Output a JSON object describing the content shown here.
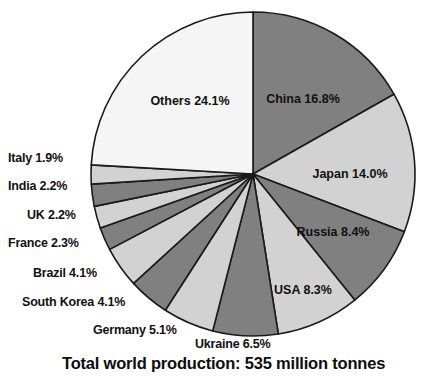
{
  "chart_data": {
    "type": "pie",
    "title": "Total world production: 535 million tonnes",
    "title_truncated": true,
    "total_label": "Total world production: 535 million tonnes",
    "total_value": 535,
    "total_units": "million tonnes",
    "start_angle_deg": 0,
    "direction": "clockwise",
    "legend": "none",
    "value_unit": "percent",
    "categories": [
      "China",
      "Japan",
      "Russia",
      "USA",
      "Ukraine",
      "Germany",
      "South Korea",
      "Brazil",
      "France",
      "UK",
      "India",
      "Italy",
      "Others"
    ],
    "values": [
      16.8,
      14.0,
      8.4,
      8.3,
      6.5,
      5.1,
      4.1,
      4.1,
      2.3,
      2.2,
      2.2,
      1.9,
      24.1
    ],
    "slices": [
      {
        "name": "China",
        "value": 16.8,
        "label": "China 16.8%",
        "color": "#808080",
        "label_placement": "inside"
      },
      {
        "name": "Japan",
        "value": 14.0,
        "label": "Japan 14.0%",
        "color": "#d2d2d2",
        "label_placement": "inside"
      },
      {
        "name": "Russia",
        "value": 8.4,
        "label": "Russia 8.4%",
        "color": "#808080",
        "label_placement": "inside"
      },
      {
        "name": "USA",
        "value": 8.3,
        "label": "USA 8.3%",
        "color": "#d2d2d2",
        "label_placement": "inside"
      },
      {
        "name": "Ukraine",
        "value": 6.5,
        "label": "Ukraine 6.5%",
        "color": "#808080",
        "label_placement": "outside"
      },
      {
        "name": "Germany",
        "value": 5.1,
        "label": "Germany 5.1%",
        "color": "#d2d2d2",
        "label_placement": "outside"
      },
      {
        "name": "South Korea",
        "value": 4.1,
        "label": "South Korea 4.1%",
        "color": "#808080",
        "label_placement": "outside"
      },
      {
        "name": "Brazil",
        "value": 4.1,
        "label": "Brazil 4.1%",
        "color": "#d2d2d2",
        "label_placement": "outside"
      },
      {
        "name": "France",
        "value": 2.3,
        "label": "France 2.3%",
        "color": "#808080",
        "label_placement": "outside"
      },
      {
        "name": "UK",
        "value": 2.2,
        "label": "UK 2.2%",
        "color": "#d2d2d2",
        "label_placement": "outside"
      },
      {
        "name": "India",
        "value": 2.2,
        "label": "India 2.2%",
        "color": "#808080",
        "label_placement": "outside"
      },
      {
        "name": "Italy",
        "value": 1.9,
        "label": "Italy 1.9%",
        "color": "#d2d2d2",
        "label_placement": "outside"
      },
      {
        "name": "Others",
        "value": 24.1,
        "label": "Others 24.1%",
        "color": "#f5f5f5",
        "label_placement": "inside"
      }
    ],
    "geometry": {
      "cx": 253,
      "cy": 174,
      "r": 162,
      "stroke": "#1a1a1a",
      "stroke_width": 1.6
    },
    "inside_label_positions": [
      {
        "name": "China",
        "x": 303,
        "y": 103,
        "anchor": "middle"
      },
      {
        "name": "Japan",
        "x": 350,
        "y": 178,
        "anchor": "middle"
      },
      {
        "name": "Russia",
        "x": 333,
        "y": 236,
        "anchor": "middle"
      },
      {
        "name": "USA",
        "x": 303,
        "y": 294,
        "anchor": "middle"
      },
      {
        "name": "Others",
        "x": 190,
        "y": 105,
        "anchor": "middle"
      }
    ],
    "outside_label_positions": [
      {
        "name": "Italy",
        "left": 8,
        "top": 151,
        "align": "left"
      },
      {
        "name": "India",
        "left": 8,
        "top": 179,
        "align": "left"
      },
      {
        "name": "UK",
        "left": 27,
        "top": 208,
        "align": "left"
      },
      {
        "name": "France",
        "left": 8,
        "top": 236,
        "align": "left"
      },
      {
        "name": "Brazil",
        "left": 33,
        "top": 266,
        "align": "left"
      },
      {
        "name": "South Korea",
        "left": 22,
        "top": 295,
        "align": "left"
      },
      {
        "name": "Germany",
        "left": 93,
        "top": 323,
        "align": "left"
      },
      {
        "name": "Ukraine",
        "left": 195,
        "top": 337,
        "align": "left"
      }
    ]
  },
  "colors": {
    "background": "#ffffff",
    "text": "#111111",
    "slice_dark": "#808080",
    "slice_light": "#d2d2d2",
    "slice_white": "#f5f5f5",
    "outline": "#1a1a1a"
  }
}
